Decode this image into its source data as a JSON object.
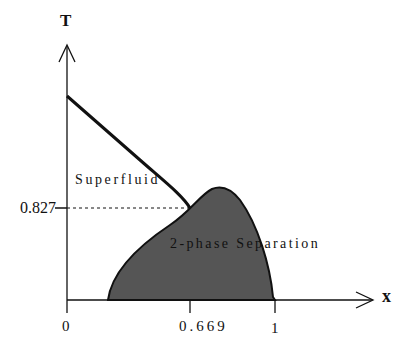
{
  "diagram": {
    "y_axis_label": "T",
    "x_axis_label": "x",
    "x_ticks": [
      "0",
      "0.669",
      "1"
    ],
    "y_tick": "0.827",
    "regions": {
      "superfluid": "Superfluid",
      "two_phase": "2-phase Separation"
    },
    "colors": {
      "fill": "#555555",
      "line": "#111111",
      "background": "#ffffff"
    }
  }
}
